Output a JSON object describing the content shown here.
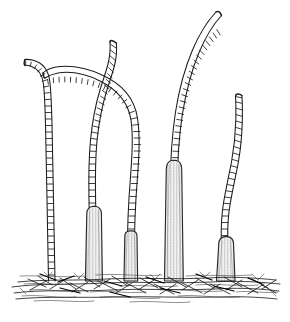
{
  "figure": {
    "title": "Stalked segmented organisms on substrate",
    "style": "black-and-white pen-and-ink line drawing",
    "background_color": "#ffffff",
    "ink_color": "#1c1c1c",
    "base_fill_color": "#efefef",
    "base_shade_color": "#c9c9c9",
    "width": 290,
    "height": 322
  },
  "ground": {
    "name": "substrate",
    "description": "dense crossing hatch lines forming a mat of debris",
    "left": 10,
    "right": 281,
    "top": 268,
    "bottom": 302
  },
  "specimens": [
    {
      "id": "specimen-1",
      "label": "leftmost tall stalk",
      "has_basal_sheath": false,
      "segment_count": 44,
      "base_x": 52,
      "base_y": 281,
      "tip_x": 26,
      "tip_y": 66,
      "curvature": "tall, nearly straight, tip hooks left and flattens"
    },
    {
      "id": "specimen-2",
      "label": "arching stalk with raised tip",
      "has_basal_sheath": true,
      "segment_count": 40,
      "base_x": 94,
      "base_y": 281,
      "tip_x": 86,
      "tip_y": 40,
      "curvature": "rises then curves with an upswept free tip"
    },
    {
      "id": "specimen-3",
      "label": "arched stalk bending right",
      "has_basal_sheath": true,
      "segment_count": 38,
      "base_x": 131,
      "base_y": 281,
      "tip_x": 50,
      "tip_y": 80,
      "curvature": "broad arch leaning left over neighbours"
    },
    {
      "id": "specimen-4",
      "label": "tall central stalk with long sheath",
      "has_basal_sheath": true,
      "segment_count": 42,
      "base_x": 175,
      "base_y": 281,
      "tip_x": 226,
      "tip_y": 12,
      "curvature": "S-curve sweeping up and right"
    },
    {
      "id": "specimen-5",
      "label": "rightmost stalk with squat sheath",
      "has_basal_sheath": true,
      "segment_count": 32,
      "base_x": 228,
      "base_y": 281,
      "tip_x": 238,
      "tip_y": 94,
      "curvature": "gentle sinuous rise to a fine tip"
    }
  ]
}
